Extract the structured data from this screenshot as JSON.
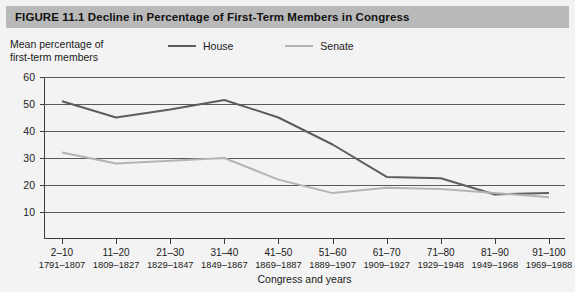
{
  "figure": {
    "title": "FIGURE 11.1  Decline in Percentage of First-Term Members in Congress",
    "banner_color": "#b9b9b9",
    "background_color": "#f3f3f3"
  },
  "axis_caption": "Mean percentage of\nfirst-term members",
  "legend": {
    "entries": [
      {
        "label": "House",
        "color": "#5d5d5d"
      },
      {
        "label": "Senate",
        "color": "#b4b4b4"
      }
    ]
  },
  "chart_data": {
    "type": "line",
    "title": "Decline in Percentage of First-Term Members in Congress",
    "xlabel": "Congress and years",
    "ylabel": "Mean percentage of first-term members",
    "ylim": [
      0,
      60
    ],
    "yticks": [
      60,
      50,
      40,
      30,
      20,
      10
    ],
    "grid": true,
    "legend_position": "top",
    "categories": [
      "2–10",
      "11–20",
      "21–30",
      "31–40",
      "41–50",
      "51–60",
      "61–70",
      "71–80",
      "81–90",
      "91–100"
    ],
    "category_years": [
      "1791–1807",
      "1809–1827",
      "1829–1847",
      "1849–1867",
      "1869–1887",
      "1889–1907",
      "1909–1927",
      "1929–1948",
      "1949–1968",
      "1969–1988"
    ],
    "series": [
      {
        "name": "House",
        "color": "#5d5d5d",
        "values": [
          51,
          45,
          48,
          51.5,
          45,
          35,
          23,
          22.5,
          16.5,
          17
        ]
      },
      {
        "name": "Senate",
        "color": "#b4b4b4",
        "values": [
          32,
          28,
          29,
          30,
          22,
          17,
          19,
          18.5,
          17,
          15.5
        ]
      }
    ]
  },
  "xaxis_title": "Congress and years"
}
